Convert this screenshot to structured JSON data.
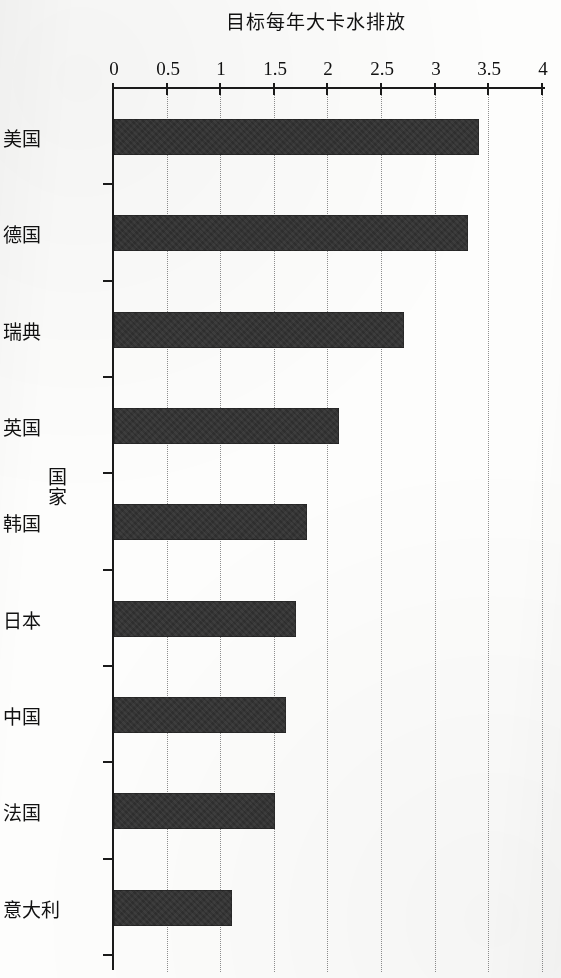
{
  "chart_data": {
    "type": "bar",
    "orientation": "horizontal",
    "title": "",
    "xlabel": "国家",
    "ylabel": "目标每年大卡水排放",
    "categories": [
      "美国",
      "德国",
      "瑞典",
      "英国",
      "韩国",
      "日本",
      "中国",
      "法国",
      "意大利"
    ],
    "values": [
      3.4,
      3.3,
      2.7,
      2.1,
      1.8,
      1.7,
      1.6,
      1.5,
      1.1
    ],
    "series": [
      {
        "name": "目标每年大卡水排放",
        "values": [
          3.4,
          3.3,
          2.7,
          2.1,
          1.8,
          1.7,
          1.6,
          1.5,
          1.1
        ]
      }
    ],
    "value_axis": {
      "min": 0,
      "max": 4,
      "tick_step": 0.5,
      "ticks": [
        "0",
        "0.5",
        "1",
        "1.5",
        "2",
        "2.5",
        "3",
        "3.5",
        "4"
      ],
      "tick_values": [
        0,
        0.5,
        1,
        1.5,
        2,
        2.5,
        3,
        3.5,
        4
      ]
    },
    "grid": {
      "value_gridlines": true,
      "style": "dotted",
      "color": "#8e8e8e"
    },
    "legend": {
      "visible": false,
      "position": "none"
    },
    "style": {
      "bar_color": "#2e2e2e",
      "axis_color": "#1a1a1a",
      "background": "#fdfdfc",
      "page_rotation_degrees": 180,
      "rendering": "scanned-photocopy grayscale"
    }
  }
}
